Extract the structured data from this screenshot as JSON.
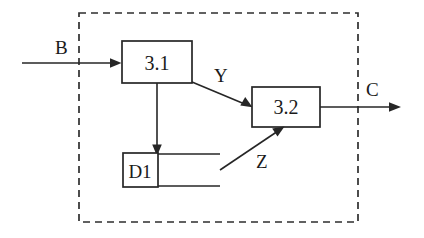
{
  "diagram": {
    "type": "data-flow-diagram",
    "title": "",
    "boundary": {
      "name": "system-boundary",
      "style": "dashed",
      "x": 79,
      "y": 13,
      "width": 279,
      "height": 209
    },
    "processes": [
      {
        "id": "p31",
        "label": "3.1",
        "x": 122,
        "y": 41,
        "width": 70,
        "height": 42
      },
      {
        "id": "p32",
        "label": "3.2",
        "x": 252,
        "y": 87,
        "width": 68,
        "height": 40
      }
    ],
    "data_stores": [
      {
        "id": "d1",
        "label": "D1",
        "box": {
          "x": 123,
          "y": 153,
          "width": 35,
          "height": 34
        },
        "line_end_x": 220
      }
    ],
    "flows": [
      {
        "id": "flow-b",
        "label": "B",
        "from": "external",
        "to": "3.1",
        "label_x": 55,
        "label_y": 54
      },
      {
        "id": "flow-y",
        "label": "Y",
        "from": "3.1",
        "to": "3.2",
        "label_x": 214,
        "label_y": 82
      },
      {
        "id": "flow-z",
        "label": "Z",
        "from": "D1",
        "to": "3.2",
        "label_x": 256,
        "label_y": 168
      },
      {
        "id": "flow-c",
        "label": "C",
        "from": "3.2",
        "to": "external",
        "label_x": 366,
        "label_y": 96
      },
      {
        "id": "flow-store-write",
        "label": "",
        "from": "3.1",
        "to": "D1",
        "label_x": 0,
        "label_y": 0
      }
    ],
    "colors": {
      "ink": "#262626",
      "background": "#ffffff",
      "boundary": "#2e2e2e"
    }
  }
}
